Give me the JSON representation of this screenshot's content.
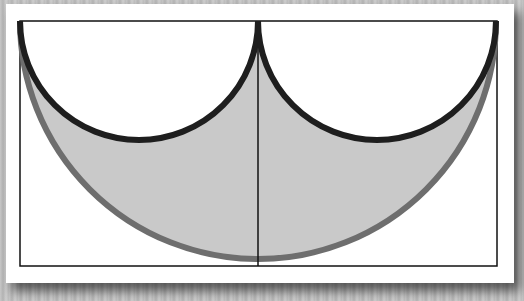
{
  "figure": {
    "colors": {
      "paper": "#ffffff",
      "background": "#bdbdbd",
      "large_fill": "#c9c9c9",
      "large_arc_stroke": "#6e6e6e",
      "small_arc_stroke": "#1e1e1e",
      "frame_stroke": "#111111"
    },
    "shapes": {
      "rectangle": {
        "x": 20,
        "y": 21,
        "width": 477,
        "height": 245
      },
      "large_semicircle": {
        "cx": 258,
        "cy": 21,
        "r": 238
      },
      "small_semicircle_left": {
        "cx": 139,
        "cy": 21,
        "r": 119
      },
      "small_semicircle_right": {
        "cx": 377,
        "cy": 21,
        "r": 119
      },
      "center_line": {
        "x": 258,
        "y1": 21,
        "y2": 266
      }
    }
  }
}
